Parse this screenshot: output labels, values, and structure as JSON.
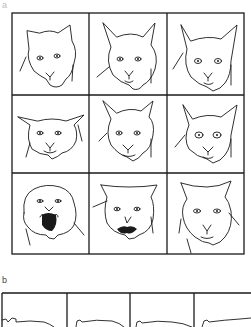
{
  "figure": {
    "panel_a": {
      "label": "a",
      "grid": {
        "rows": 3,
        "cols": 3
      },
      "cells": [
        {
          "row": 0,
          "col": 0,
          "expression": "relaxed-cat-face"
        },
        {
          "row": 0,
          "col": 1,
          "expression": "alert-cat-face"
        },
        {
          "row": 0,
          "col": 2,
          "expression": "alert-cat-face-ears-forward"
        },
        {
          "row": 1,
          "col": 0,
          "expression": "ears-flattened-cat-face"
        },
        {
          "row": 1,
          "col": 1,
          "expression": "neutral-cat-face"
        },
        {
          "row": 1,
          "col": 2,
          "expression": "wide-eyed-cat-face"
        },
        {
          "row": 2,
          "col": 0,
          "expression": "hissing-cat-face-ears-back"
        },
        {
          "row": 2,
          "col": 1,
          "expression": "snarling-cat-face-ears-sideways"
        },
        {
          "row": 2,
          "col": 2,
          "expression": "ears-rotated-cat-face"
        }
      ]
    },
    "panel_b": {
      "label": "b",
      "cells_visible": 4,
      "content": "cat-body-profile-outlines"
    }
  }
}
